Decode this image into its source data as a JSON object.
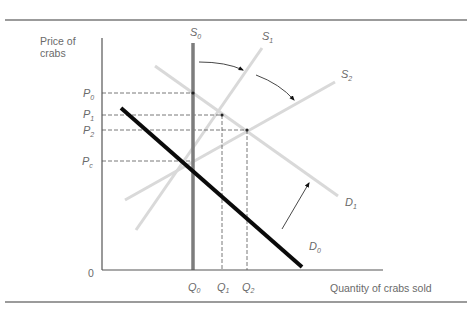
{
  "diagram": {
    "title": "",
    "y_axis_label_line1": "Price of",
    "y_axis_label_line2": "crabs",
    "x_axis_label": "Quantity of crabs sold",
    "origin_label": "0",
    "price_labels": [
      {
        "base": "P",
        "sub": "0"
      },
      {
        "base": "P",
        "sub": "1"
      },
      {
        "base": "P",
        "sub": "2"
      },
      {
        "base": "P",
        "sub": "c"
      }
    ],
    "quantity_labels": [
      {
        "base": "Q",
        "sub": "0"
      },
      {
        "base": "Q",
        "sub": "1"
      },
      {
        "base": "Q",
        "sub": "2"
      }
    ],
    "curves": {
      "S0": {
        "base": "S",
        "sub": "0",
        "description": "vertical supply curve (fixed quantity)"
      },
      "S1": {
        "base": "S",
        "sub": "1",
        "description": "rotated supply curve"
      },
      "S2": {
        "base": "S",
        "sub": "2",
        "description": "further rotated supply curve"
      },
      "D0": {
        "base": "D",
        "sub": "0",
        "description": "initial demand curve"
      },
      "D1": {
        "base": "D",
        "sub": "1",
        "description": "shifted demand curve"
      }
    },
    "colors": {
      "axis": "#555555",
      "rule": "#7a7a7a",
      "s0": "#7d7d7d",
      "light_curve": "#d9d9d9",
      "demand0": "#0a0a0a",
      "dashed": "#555555",
      "label": "#6a6a6a"
    }
  }
}
